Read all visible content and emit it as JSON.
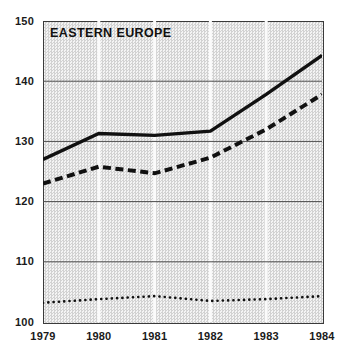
{
  "chart_data": {
    "type": "line",
    "title": "EASTERN EUROPE",
    "xlabel": "",
    "ylabel": "",
    "x": [
      1979,
      1980,
      1981,
      1982,
      1983,
      1984
    ],
    "xtick_labels": [
      "1979",
      "1980",
      "1981",
      "1982",
      "1983",
      "1984"
    ],
    "ytick_labels": [
      "150",
      "140",
      "130",
      "120",
      "110",
      "100"
    ],
    "yticks": [
      150,
      140,
      130,
      120,
      110,
      100
    ],
    "xlim": [
      1979,
      1984
    ],
    "ylim": [
      100,
      150
    ],
    "grid": "horizontal-gridlines-dark-and-vertical-gridlines-light",
    "legend": "none",
    "plot_background": "#e9e9e9",
    "series": [
      {
        "name": "solid-line",
        "style": "solid",
        "color": "#111111",
        "values": [
          127.0,
          131.3,
          131.0,
          131.7,
          137.8,
          144.3
        ]
      },
      {
        "name": "dashed-line",
        "style": "dashed",
        "color": "#111111",
        "values": [
          123.0,
          125.8,
          124.7,
          127.3,
          132.0,
          137.8
        ]
      },
      {
        "name": "dotted-line",
        "style": "dotted",
        "color": "#111111",
        "values": [
          103.2,
          103.8,
          104.3,
          103.5,
          103.8,
          104.3
        ]
      }
    ]
  }
}
